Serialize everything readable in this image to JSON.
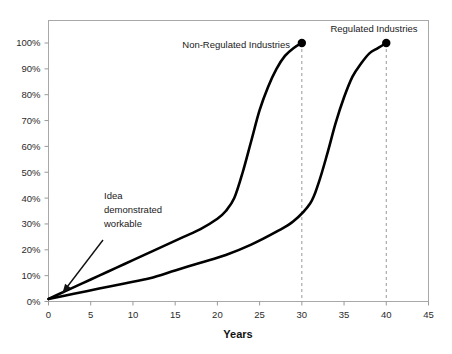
{
  "chart_data": {
    "type": "line",
    "title": "",
    "xlabel": "Years",
    "ylabel": "",
    "xlim": [
      0,
      45
    ],
    "ylim": [
      0,
      100
    ],
    "grid": false,
    "legend_position": "inline-curve-labels",
    "x_ticks": [
      "0",
      "5",
      "10",
      "15",
      "20",
      "25",
      "30",
      "35",
      "40",
      "45"
    ],
    "x_tick_values": [
      0,
      5,
      10,
      15,
      20,
      25,
      30,
      35,
      40,
      45
    ],
    "y_ticks": [
      "0%",
      "10%",
      "20%",
      "30%",
      "40%",
      "50%",
      "60%",
      "70%",
      "80%",
      "90%",
      "100%"
    ],
    "y_tick_values": [
      0,
      10,
      20,
      30,
      40,
      50,
      60,
      70,
      80,
      90,
      100
    ],
    "series": [
      {
        "name": "Non-Regulated Industries",
        "label": "Non-Regulated Industries",
        "color": "#000000",
        "endpoint_marker": true,
        "endpoint_x": 30,
        "endpoint_y": 100,
        "dropline_x": 30,
        "x": [
          0,
          2,
          4,
          6,
          8,
          10,
          12,
          14,
          16,
          18,
          20,
          21,
          22,
          23,
          24,
          25,
          26,
          27,
          28,
          29,
          30
        ],
        "values": [
          1,
          4,
          7,
          10,
          13,
          16,
          19,
          22,
          25,
          28,
          32,
          35,
          40,
          50,
          62,
          74,
          83,
          90,
          95,
          98,
          100
        ]
      },
      {
        "name": "Regulated Industries",
        "label": "Regulated Industries",
        "color": "#000000",
        "endpoint_marker": true,
        "endpoint_x": 40,
        "endpoint_y": 100,
        "dropline_x": 40,
        "x": [
          0,
          3,
          6,
          9,
          12,
          15,
          18,
          21,
          24,
          27,
          29,
          31,
          32,
          33,
          34,
          35,
          36,
          37,
          38,
          39,
          40
        ],
        "values": [
          1,
          3,
          5,
          7,
          9,
          12,
          15,
          18,
          22,
          27,
          31,
          38,
          46,
          57,
          69,
          79,
          87,
          92,
          96,
          98,
          100
        ]
      }
    ],
    "annotations": [
      {
        "name": "idea-demonstrated-workable",
        "lines": [
          "Idea",
          "demonstrated",
          "workable"
        ],
        "text": "Idea demonstrated workable",
        "points_to_x": 0,
        "points_to_y": 0
      }
    ],
    "droplines": [
      {
        "x": 30,
        "style": "dashed",
        "color": "#999999"
      },
      {
        "x": 40,
        "style": "dashed",
        "color": "#999999"
      }
    ]
  },
  "axes": {
    "x_title": "Years"
  },
  "colors": {
    "curve": "#000000",
    "dropline": "#9a9a9a",
    "border": "#a8a8a8",
    "tick": "#9a9a9a",
    "text": "#1a1a1a",
    "background": "#ffffff"
  }
}
